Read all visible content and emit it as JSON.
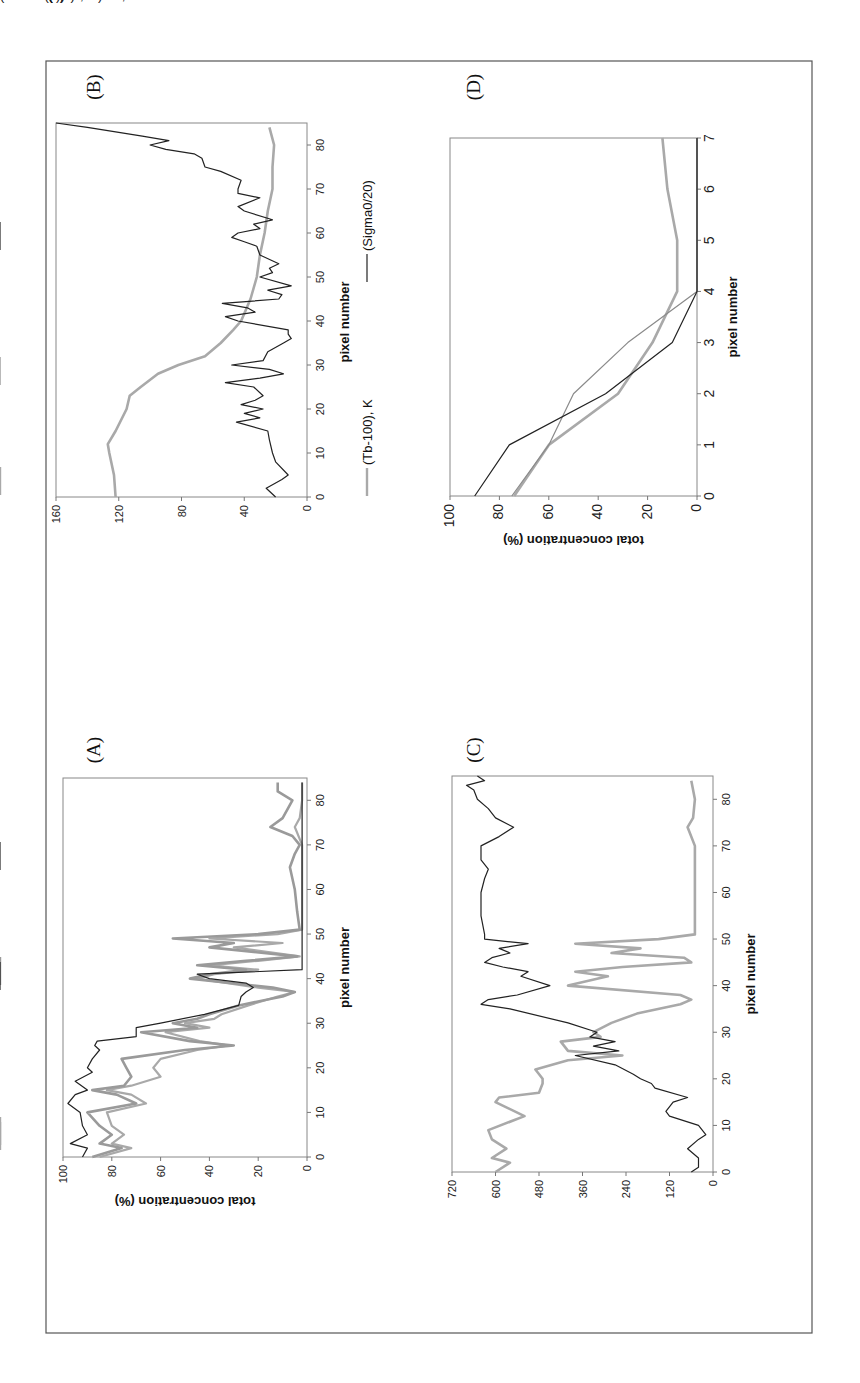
{
  "figure": {
    "orientation": "rotated 90 degrees counter-clockwise",
    "panels": [
      {
        "id": "A",
        "label": "(A)"
      },
      {
        "id": "B",
        "label": "(B)"
      },
      {
        "id": "C",
        "label": "(C)"
      },
      {
        "id": "D",
        "label": "(D)"
      }
    ]
  },
  "chart_data": [
    {
      "panel": "(A)",
      "type": "line",
      "title": "",
      "xlabel": "pixel number",
      "ylabel": "total concentration (%)",
      "xlim": [
        0,
        85
      ],
      "ylim": [
        0,
        100
      ],
      "xticks": [
        "0",
        "10",
        "20",
        "30",
        "40",
        "50",
        "60",
        "70",
        "80"
      ],
      "yticks": [
        "0",
        "20",
        "40",
        "60",
        "80",
        "100"
      ],
      "legend": [
        "AVHRR (1,4)",
        "AVHRR (1)",
        "OKEAN"
      ],
      "legend_position": "bottom",
      "series": [
        {
          "name": "AVHRR (1,4)",
          "color": "#a9a9a9",
          "width": 2.2,
          "x": [
            0,
            2,
            3,
            5,
            7,
            10,
            12,
            14,
            15,
            16,
            18,
            20,
            22,
            24,
            25,
            26,
            28,
            29,
            30,
            31,
            32,
            34,
            36,
            37,
            38,
            40,
            41,
            42,
            43,
            44,
            45,
            47,
            48,
            49,
            50,
            51,
            60,
            70,
            74,
            76,
            80,
            84
          ],
          "values": [
            85,
            72,
            80,
            75,
            80,
            82,
            66,
            72,
            82,
            72,
            60,
            63,
            60,
            45,
            32,
            44,
            58,
            40,
            50,
            38,
            35,
            24,
            12,
            5,
            20,
            45,
            38,
            20,
            40,
            20,
            3,
            30,
            10,
            40,
            12,
            2,
            2,
            2,
            5,
            3,
            2,
            2
          ]
        },
        {
          "name": "AVHRR (1)",
          "color": "#9a9a9a",
          "width": 2.6,
          "x": [
            0,
            2,
            3,
            5,
            7,
            10,
            12,
            14,
            15,
            16,
            18,
            20,
            22,
            24,
            25,
            26,
            28,
            29,
            30,
            31,
            32,
            34,
            36,
            37,
            38,
            40,
            41,
            42,
            43,
            44,
            45,
            47,
            48,
            49,
            50,
            51,
            55,
            60,
            65,
            68,
            70,
            72,
            74,
            76,
            80,
            82,
            84
          ],
          "values": [
            88,
            76,
            85,
            80,
            85,
            90,
            70,
            78,
            88,
            75,
            72,
            74,
            76,
            50,
            30,
            48,
            68,
            45,
            55,
            45,
            40,
            28,
            10,
            5,
            14,
            48,
            40,
            25,
            45,
            25,
            4,
            40,
            30,
            55,
            20,
            3,
            4,
            5,
            7,
            5,
            3,
            6,
            15,
            10,
            6,
            12,
            12
          ]
        },
        {
          "name": "OKEAN",
          "color": "#222222",
          "width": 1.2,
          "x": [
            0,
            2,
            3,
            5,
            7,
            10,
            12,
            14,
            15,
            17,
            19,
            20,
            22,
            24,
            25,
            26,
            27,
            29,
            30,
            32,
            33,
            34,
            36,
            37,
            38,
            39,
            40,
            41,
            42,
            45,
            84
          ],
          "values": [
            92,
            90,
            97,
            90,
            92,
            93,
            98,
            95,
            90,
            95,
            88,
            90,
            88,
            85,
            87,
            86,
            70,
            70,
            60,
            42,
            35,
            28,
            27,
            25,
            22,
            25,
            40,
            45,
            2,
            2,
            2
          ]
        }
      ]
    },
    {
      "panel": "(B)",
      "type": "line",
      "title": "",
      "xlabel": "pixel number",
      "ylabel": "",
      "xlim": [
        0,
        85
      ],
      "ylim": [
        0,
        160
      ],
      "xticks": [
        "0",
        "10",
        "20",
        "30",
        "40",
        "50",
        "60",
        "70",
        "80"
      ],
      "yticks": [
        "0",
        "40",
        "80",
        "120",
        "160"
      ],
      "legend": [
        "(Tb-100), K",
        "(Sigma0/20)"
      ],
      "legend_position": "bottom",
      "series": [
        {
          "name": "(Tb-100), K",
          "color": "#a9a9a9",
          "width": 2.6,
          "x": [
            0,
            5,
            10,
            12,
            15,
            20,
            23,
            25,
            28,
            30,
            32,
            35,
            38,
            40,
            45,
            50,
            55,
            60,
            65,
            70,
            75,
            80,
            84
          ],
          "values": [
            122,
            123,
            126,
            127,
            122,
            115,
            113,
            106,
            95,
            82,
            65,
            55,
            47,
            42,
            36,
            32,
            30,
            27,
            25,
            22,
            22,
            21,
            24
          ]
        },
        {
          "name": "(Sigma0/20)",
          "color": "#222222",
          "width": 1.2,
          "x": [
            0,
            2,
            4,
            5,
            8,
            10,
            13,
            15,
            17,
            18,
            19,
            20,
            21,
            22,
            23,
            25,
            26,
            27,
            28,
            29,
            30,
            31,
            33,
            35,
            36,
            37,
            38,
            40,
            41,
            42,
            43,
            44,
            45,
            46,
            47,
            48,
            50,
            51,
            52,
            53,
            55,
            57,
            58,
            59,
            60,
            61,
            62,
            63,
            65,
            66,
            68,
            69,
            70,
            72,
            74,
            75,
            77,
            78,
            79,
            80,
            81,
            82,
            84,
            85
          ],
          "values": [
            20,
            26,
            16,
            12,
            20,
            22,
            24,
            25,
            45,
            30,
            40,
            28,
            42,
            33,
            28,
            34,
            52,
            30,
            15,
            24,
            48,
            28,
            25,
            15,
            10,
            12,
            12,
            44,
            52,
            33,
            38,
            54,
            18,
            16,
            25,
            10,
            30,
            22,
            24,
            18,
            30,
            32,
            40,
            48,
            44,
            30,
            34,
            22,
            40,
            44,
            30,
            44,
            44,
            42,
            55,
            65,
            67,
            72,
            90,
            100,
            88,
            105,
            140,
            160
          ]
        }
      ]
    },
    {
      "panel": "(C)",
      "type": "line",
      "title": "",
      "xlabel": "pixel number",
      "ylabel": "",
      "xlim": [
        0,
        85
      ],
      "ylim": [
        0,
        720
      ],
      "xticks": [
        "0",
        "10",
        "20",
        "30",
        "40",
        "50",
        "60",
        "70",
        "80"
      ],
      "yticks": [
        "0",
        "120",
        "240",
        "360",
        "480",
        "600",
        "720"
      ],
      "legend": [
        "AVHRR(1)*10, %",
        "(AVHRR(4) - 260)*70, K"
      ],
      "legend_position": "bottom",
      "series": [
        {
          "name": "AVHRR(1)*10, %",
          "color": "#a9a9a9",
          "width": 2.6,
          "x": [
            0,
            2,
            3,
            5,
            7,
            9,
            12,
            15,
            16,
            17,
            19,
            20,
            22,
            24,
            25,
            26,
            28,
            29,
            30,
            32,
            34,
            36,
            37,
            38,
            40,
            42,
            43,
            44,
            45,
            46,
            47,
            48,
            49,
            50,
            51,
            55,
            65,
            70,
            74,
            76,
            80,
            84
          ],
          "values": [
            600,
            560,
            610,
            570,
            610,
            620,
            520,
            600,
            590,
            480,
            470,
            470,
            490,
            400,
            250,
            400,
            420,
            310,
            330,
            280,
            210,
            90,
            60,
            90,
            400,
            290,
            380,
            250,
            60,
            80,
            280,
            200,
            380,
            150,
            50,
            50,
            50,
            50,
            70,
            55,
            50,
            60
          ]
        },
        {
          "name": "(AVHRR(4) - 260)*70, K",
          "color": "#222222",
          "width": 1.2,
          "x": [
            0,
            1,
            3,
            5,
            7,
            8,
            10,
            12,
            13,
            15,
            16,
            18,
            19,
            20,
            21,
            23,
            25,
            26,
            27,
            28,
            29,
            30,
            32,
            35,
            36,
            37,
            38,
            40,
            42,
            43,
            44,
            45,
            46,
            47,
            48,
            49,
            50,
            51,
            55,
            60,
            63,
            65,
            67,
            70,
            72,
            74,
            76,
            78,
            80,
            82,
            83,
            84,
            85
          ],
          "values": [
            60,
            40,
            40,
            70,
            40,
            20,
            40,
            120,
            130,
            110,
            70,
            160,
            170,
            200,
            220,
            270,
            380,
            260,
            330,
            270,
            340,
            320,
            400,
            560,
            640,
            620,
            540,
            450,
            530,
            510,
            580,
            630,
            610,
            560,
            590,
            510,
            630,
            630,
            640,
            640,
            630,
            620,
            640,
            640,
            590,
            550,
            600,
            620,
            650,
            660,
            680,
            630,
            650
          ]
        }
      ]
    },
    {
      "panel": "(D)",
      "type": "line",
      "title": "",
      "xlabel": "pixel number",
      "ylabel": "total concentration (%)",
      "xlim": [
        0,
        7
      ],
      "ylim": [
        0,
        100
      ],
      "xticks": [
        "0",
        "1",
        "2",
        "3",
        "4",
        "5",
        "6",
        "7"
      ],
      "yticks": [
        "0",
        "20",
        "40",
        "60",
        "80",
        "100"
      ],
      "legend": [
        "AVHRR",
        "SSM/I",
        "OKEAN"
      ],
      "legend_position": "bottom",
      "series": [
        {
          "name": "AVHRR",
          "color": "#a9a9a9",
          "width": 2.6,
          "x": [
            0,
            1,
            2,
            3,
            4,
            5,
            6,
            7
          ],
          "values": [
            74,
            60,
            32,
            18,
            8,
            8,
            12,
            14
          ]
        },
        {
          "name": "SSM/I",
          "color": "#8a8a8a",
          "width": 1.2,
          "x": [
            0,
            1,
            2,
            3,
            4,
            5,
            6,
            7
          ],
          "values": [
            75,
            60,
            50,
            28,
            0,
            0,
            0,
            0
          ]
        },
        {
          "name": "OKEAN",
          "color": "#222222",
          "width": 1.2,
          "x": [
            0,
            1,
            2,
            3,
            4,
            5,
            6,
            7
          ],
          "values": [
            90,
            76,
            37,
            10,
            0,
            0,
            0,
            0
          ]
        }
      ]
    }
  ]
}
